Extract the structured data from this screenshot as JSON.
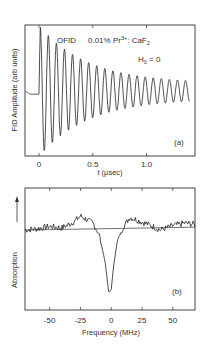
{
  "chart_data": [
    {
      "type": "line",
      "panel": "(a)",
      "title": "",
      "annotations": [
        "OFID",
        "0.01% Pr3+ : CaF2",
        "H0 = 0",
        "(a)"
      ],
      "annotation_parts": {
        "method": "OFID",
        "sample_prefix": "0.01% Pr",
        "sample_sup": "3+",
        "sample_suffix": ": CaF",
        "sample_sub": "2",
        "field_main": "H",
        "field_sub": "0",
        "field_value": " = 0",
        "panel_label": "(a)"
      },
      "xlabel": "t (μsec)",
      "ylabel": "FID Amplitude (arb units)",
      "xlim": [
        -0.13,
        1.45
      ],
      "xticks": [
        0,
        0.5,
        1.0
      ],
      "xtick_labels": [
        "0",
        "0.5",
        "1.0"
      ],
      "grid": false,
      "description": "Damped oscillation (optical free induction decay) starting at t=0, period ~0.075 μsec, decaying over ~1.4 μsec; flat baseline for t<0",
      "series": [
        {
          "name": "FID",
          "oscillation_period_usec": 0.075,
          "decay_constant_usec": 0.45,
          "initial_amplitude": 1.0,
          "baseline": 0.0,
          "pre_trigger_level": -0.05
        }
      ]
    },
    {
      "type": "line",
      "panel": "(b)",
      "title": "",
      "annotations": [
        "(b)"
      ],
      "xlabel": "Frequency (MHz)",
      "ylabel": "Absorption",
      "ylabel_arrow": true,
      "xlim": [
        -70,
        68
      ],
      "xticks": [
        -50,
        -25,
        0,
        25,
        50
      ],
      "xtick_labels": [
        "-50",
        "-25",
        "0",
        "25",
        "50"
      ],
      "grid": false,
      "description": "Noisy absorption spectrum with a sharp dip (hole) centered near 0 MHz of FWHM ~10 MHz, with shoulders rising around -25 and +15 MHz, plus a straight baseline reference line",
      "series": [
        {
          "name": "spectrum",
          "x": [
            -70,
            -60,
            -50,
            -40,
            -30,
            -25,
            -20,
            -15,
            -10,
            -5,
            -2,
            0,
            2,
            5,
            10,
            15,
            20,
            30,
            40,
            50,
            60,
            68
          ],
          "y": [
            0.0,
            0.02,
            0.05,
            0.03,
            0.12,
            0.2,
            0.15,
            0.1,
            -0.05,
            -0.45,
            -0.9,
            -0.85,
            -0.5,
            -0.15,
            0.05,
            0.18,
            0.15,
            0.08,
            0.0,
            0.06,
            0.1,
            0.08
          ]
        },
        {
          "name": "baseline",
          "x": [
            -70,
            68
          ],
          "y": [
            0.0,
            0.04
          ]
        }
      ],
      "panel_label": "(b)"
    }
  ]
}
